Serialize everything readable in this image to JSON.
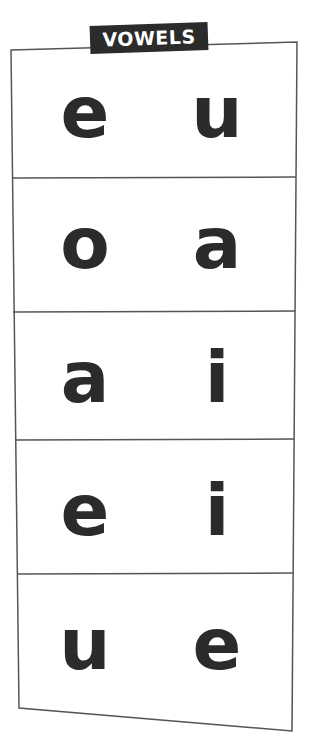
{
  "title": "VOWELS",
  "colors": {
    "ink": "#2b2b2b",
    "line": "#555555",
    "paper": "#ffffff"
  },
  "rows": [
    {
      "left": "e",
      "right": "u"
    },
    {
      "left": "o",
      "right": "a"
    },
    {
      "left": "a",
      "right": "i"
    },
    {
      "left": "e",
      "right": "i"
    },
    {
      "left": "u",
      "right": "e"
    }
  ]
}
